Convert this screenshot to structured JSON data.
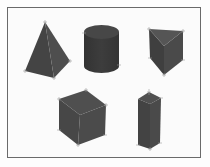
{
  "figure": {
    "title": "",
    "background": "#fbfbfb",
    "frame_color": "#6a6a6a",
    "shapes": [
      {
        "name": "square-pyramid",
        "label": ""
      },
      {
        "name": "cylinder",
        "label": ""
      },
      {
        "name": "triangular-prism",
        "label": ""
      },
      {
        "name": "cube",
        "label": ""
      },
      {
        "name": "rectangular-prism",
        "label": ""
      }
    ],
    "colors": {
      "face_dark": "#3c3c3c",
      "face_mid": "#484848",
      "face_light": "#555555",
      "vertex_marker": "#9a9a9a"
    }
  }
}
